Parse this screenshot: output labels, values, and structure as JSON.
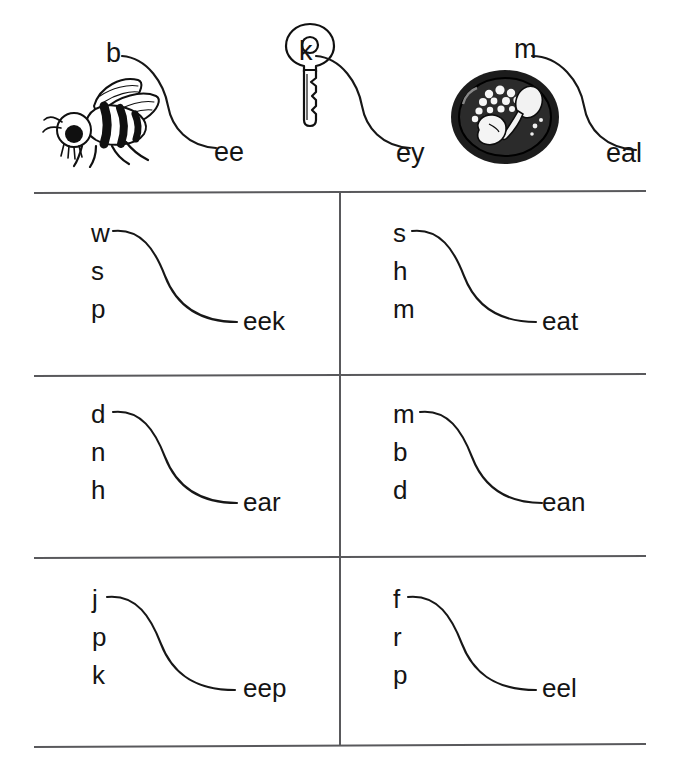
{
  "page": {
    "background_color": "#ffffff",
    "ink_color": "#141414",
    "rule_color": "#59595c"
  },
  "examples": [
    {
      "id": "bee",
      "picture": "bee-illustration",
      "picture_alt": "bee",
      "onset": "b",
      "rime": "ee",
      "word": "bee"
    },
    {
      "id": "key",
      "picture": "key-illustration",
      "picture_alt": "key",
      "onset": "k",
      "rime": "ey",
      "word": "key"
    },
    {
      "id": "meal",
      "picture": "meal-plate-illustration",
      "picture_alt": "plate of food",
      "onset": "m",
      "rime": "eal",
      "word": "meal"
    }
  ],
  "exercises": [
    {
      "id": "eek",
      "row": 1,
      "column": "left",
      "onsets": [
        "w",
        "s",
        "p"
      ],
      "rime": "eek",
      "words": [
        "week",
        "seek",
        "peek"
      ]
    },
    {
      "id": "eat",
      "row": 1,
      "column": "right",
      "onsets": [
        "s",
        "h",
        "m"
      ],
      "rime": "eat",
      "words": [
        "seat",
        "heat",
        "meat"
      ]
    },
    {
      "id": "ear",
      "row": 2,
      "column": "left",
      "onsets": [
        "d",
        "n",
        "h"
      ],
      "rime": "ear",
      "words": [
        "dear",
        "near",
        "hear"
      ]
    },
    {
      "id": "ean",
      "row": 2,
      "column": "right",
      "onsets": [
        "m",
        "b",
        "d"
      ],
      "rime": "ean",
      "words": [
        "mean",
        "bean",
        "dean"
      ]
    },
    {
      "id": "eep",
      "row": 3,
      "column": "left",
      "onsets": [
        "j",
        "p",
        "k"
      ],
      "rime": "eep",
      "words": [
        "jeep",
        "peep",
        "keep"
      ]
    },
    {
      "id": "eel",
      "row": 3,
      "column": "right",
      "onsets": [
        "f",
        "r",
        "p"
      ],
      "rime": "eel",
      "words": [
        "feel",
        "reel",
        "peel"
      ]
    }
  ]
}
